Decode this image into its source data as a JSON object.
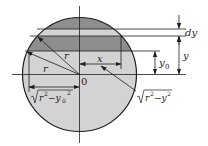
{
  "diagram": {
    "title": "",
    "colors": {
      "light_fill": "#d3d3d3",
      "dark_fill": "#8e8e8e",
      "stroke": "#1e1e1e",
      "background": "#ffffff"
    },
    "labels": {
      "origin": "0",
      "radius_upper": "r",
      "radius_lower": "r",
      "x": "x",
      "y0": "y",
      "y0_sub": "0",
      "y": "y",
      "dy": "dy",
      "sqrt_left_inner": "r",
      "sqrt_left_exp": "2",
      "sqrt_left_minus": "−y",
      "sqrt_left_sub": "0",
      "sqrt_left_exp2": "2",
      "sqrt_right_inner": "r",
      "sqrt_right_exp": "2",
      "sqrt_right_minus": "−y",
      "sqrt_right_exp2": "2"
    }
  }
}
